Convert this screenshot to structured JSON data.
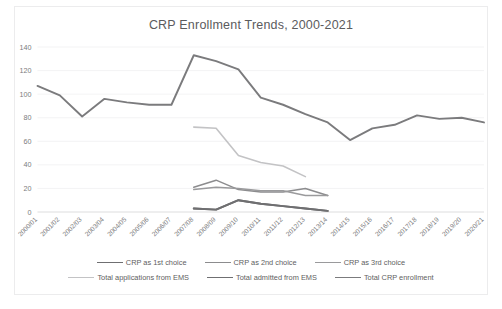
{
  "chart_data": {
    "type": "line",
    "title": "CRP Enrollment Trends, 2000-2021",
    "xlabel": "",
    "ylabel": "",
    "ylim": [
      0,
      140
    ],
    "ytick_step": 20,
    "yticks": [
      "0",
      "20",
      "40",
      "60",
      "80",
      "100",
      "120",
      "140"
    ],
    "grid": true,
    "legend_position": "bottom",
    "categories": [
      "2000/01",
      "2001/02",
      "2002/03",
      "2003/04",
      "2004/05",
      "2005/06",
      "2006/07",
      "2007/08",
      "2008/09",
      "2009/10",
      "2010/11",
      "2011/12",
      "2012/13",
      "2013/14",
      "2014/15",
      "2015/16",
      "2016/17",
      "2017/18",
      "2018/19",
      "2019/20",
      "2020/21"
    ],
    "series": [
      {
        "name": "CRP as 1st choice",
        "color": "#6f6f71",
        "width": 1.9,
        "values": [
          null,
          null,
          null,
          null,
          null,
          null,
          null,
          3,
          2,
          10,
          7,
          5,
          3,
          1,
          null,
          null,
          null,
          null,
          null,
          null,
          null
        ]
      },
      {
        "name": "CRP as 2nd choice",
        "color": "#8c8c8e",
        "width": 1.5,
        "values": [
          null,
          null,
          null,
          null,
          null,
          null,
          null,
          21,
          27,
          19,
          17,
          17,
          20,
          14,
          null,
          null,
          null,
          null,
          null,
          null,
          null
        ]
      },
      {
        "name": "CRP as 3rd choice",
        "color": "#9a9a9c",
        "width": 1.5,
        "values": [
          null,
          null,
          null,
          null,
          null,
          null,
          null,
          19,
          21,
          20,
          18,
          18,
          14,
          14,
          null,
          null,
          null,
          null,
          null,
          null,
          null
        ]
      },
      {
        "name": "Total applications from EMS",
        "color": "#c3c3c5",
        "width": 1.6,
        "values": [
          null,
          null,
          null,
          null,
          null,
          null,
          null,
          72,
          71,
          48,
          42,
          39,
          30,
          null,
          null,
          null,
          null,
          null,
          null,
          null,
          null
        ]
      },
      {
        "name": "Total admitted from EMS",
        "color": "#6f6f71",
        "width": 1.9,
        "values": [
          null,
          null,
          null,
          null,
          null,
          null,
          null,
          3,
          2,
          10,
          7,
          5,
          3,
          1,
          null,
          null,
          null,
          null,
          null,
          null,
          null
        ]
      },
      {
        "name": "Total CRP enrollment",
        "color": "#7b7b7d",
        "width": 1.9,
        "values": [
          107,
          99,
          81,
          96,
          93,
          91,
          91,
          133,
          128,
          121,
          97,
          91,
          83,
          76,
          61,
          71,
          74,
          82,
          79,
          80,
          76
        ]
      }
    ]
  },
  "legend": {
    "rows": [
      [
        {
          "label": "CRP as 1st choice",
          "color": "#6f6f71"
        },
        {
          "label": "CRP as 2nd choice",
          "color": "#8c8c8e"
        },
        {
          "label": "CRP as 3rd choice",
          "color": "#9a9a9c"
        }
      ],
      [
        {
          "label": "Total applications from EMS",
          "color": "#c3c3c5"
        },
        {
          "label": "Total admitted from EMS",
          "color": "#6f6f71"
        },
        {
          "label": "Total CRP enrollment",
          "color": "#7b7b7d"
        }
      ]
    ]
  }
}
